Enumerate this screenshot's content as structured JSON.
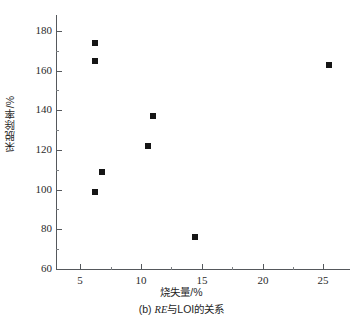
{
  "chart_data": {
    "type": "scatter",
    "title": "",
    "caption_prefix": "(b)",
    "caption_series": "RE",
    "caption_suffix": "与LOI的关系",
    "xlabel": "烧失量/%",
    "ylabel": "采脱除率/%",
    "xlim": [
      3.0,
      27.2
    ],
    "ylim": [
      60,
      188
    ],
    "xticks": [
      5,
      10,
      15,
      20,
      25
    ],
    "yticks": [
      60,
      80,
      100,
      120,
      140,
      160,
      180
    ],
    "x_minor_ticks": [
      7.5,
      12.5,
      17.5,
      22.5
    ],
    "y_minor_ticks": [
      70,
      90,
      110,
      130,
      150,
      170
    ],
    "grid": false,
    "legend": "none",
    "marker_style": "filled-square",
    "marker_color": "#151515",
    "axis_color": "#55585c",
    "background_color": "#ffffff",
    "points": [
      {
        "x": 6.2,
        "y": 174
      },
      {
        "x": 6.2,
        "y": 165
      },
      {
        "x": 6.8,
        "y": 109
      },
      {
        "x": 6.2,
        "y": 99
      },
      {
        "x": 10.6,
        "y": 122
      },
      {
        "x": 11.0,
        "y": 137
      },
      {
        "x": 14.4,
        "y": 76
      },
      {
        "x": 25.5,
        "y": 163
      }
    ]
  }
}
